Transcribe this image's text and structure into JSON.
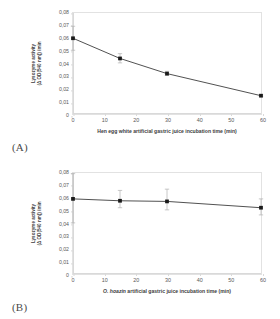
{
  "figure": {
    "background": "#ffffff",
    "axis_color": "#d9d9d9",
    "series_color": "#3a3a3a",
    "marker_color": "#1a1a1a",
    "error_bar_color": "#b0b0b0"
  },
  "panels": [
    {
      "tag": "(A)",
      "chart_data": {
        "type": "line",
        "title": "",
        "xlabel": "Hen egg white artificial gastric juice incubation time (min)",
        "ylabel_line1": "Lysozyme activity",
        "ylabel_line2": "(Δ OD(540 nm)) /min",
        "x": [
          0,
          15,
          30,
          60
        ],
        "values": [
          0.06,
          0.044,
          0.032,
          0.0145
        ],
        "error_low": [
          0.0505,
          0.0405,
          0.0305,
          0.0138
        ],
        "error_high": [
          0.0695,
          0.0478,
          0.0338,
          0.0152
        ],
        "xlim": [
          0,
          60
        ],
        "ylim": [
          0,
          0.08
        ],
        "xticks": [
          0,
          10,
          20,
          30,
          40,
          50,
          60
        ],
        "xticklabels": [
          "0",
          "10",
          "20",
          "30",
          "40",
          "50",
          "60"
        ],
        "yticks": [
          0,
          0.01,
          0.02,
          0.03,
          0.04,
          0.05,
          0.06,
          0.07,
          0.08
        ],
        "yticklabels": [
          "0",
          "0,01",
          "0,02",
          "0,03",
          "0,04",
          "0,05",
          "0,06",
          "0,07",
          "0,08"
        ],
        "grid": false,
        "legend": "none"
      }
    },
    {
      "tag": "(B)",
      "chart_data": {
        "type": "line",
        "title": "",
        "xlabel_italic": "O. hoazin",
        "xlabel_rest": " artificial gastric juice incubation time (min)",
        "xlabel": "O. hoazin artificial gastric juice incubation time (min)",
        "ylabel_line1": "Lysozyme activity",
        "ylabel_line2": "(Δ OD(540 nm)) /min",
        "x": [
          0,
          15,
          30,
          60
        ],
        "values": [
          0.0595,
          0.058,
          0.0575,
          0.0525
        ],
        "error_low": [
          0.0405,
          0.0525,
          0.0508,
          0.0468
        ],
        "error_high": [
          0.0795,
          0.0662,
          0.0672,
          0.0595
        ],
        "xlim": [
          0,
          60
        ],
        "ylim": [
          0,
          0.08
        ],
        "xticks": [
          0,
          10,
          20,
          30,
          40,
          50,
          60
        ],
        "xticklabels": [
          "0",
          "10",
          "20",
          "30",
          "40",
          "50",
          "60"
        ],
        "yticks": [
          0,
          0.01,
          0.02,
          0.03,
          0.04,
          0.05,
          0.06,
          0.07,
          0.08
        ],
        "yticklabels": [
          "0",
          "0,01",
          "0,02",
          "0,03",
          "0,04",
          "0,05",
          "0,06",
          "0,07",
          "0,08"
        ],
        "grid": false,
        "legend": "none"
      }
    }
  ]
}
